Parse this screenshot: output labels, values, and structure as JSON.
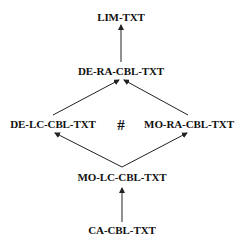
{
  "diagram": {
    "nodes": [
      {
        "id": "lim",
        "label": "LIM-TXT",
        "x": 121,
        "y": 17
      },
      {
        "id": "de_ra",
        "label": "DE-RA-CBL-TXT",
        "x": 121,
        "y": 71
      },
      {
        "id": "de_lc",
        "label": "DE-LC-CBL-TXT",
        "x": 53,
        "y": 124
      },
      {
        "id": "mo_ra",
        "label": "MO-RA-CBL-TXT",
        "x": 189,
        "y": 124
      },
      {
        "id": "mo_lc",
        "label": "MO-LC-CBL-TXT",
        "x": 122,
        "y": 177
      },
      {
        "id": "ca",
        "label": "CA-CBL-TXT",
        "x": 122,
        "y": 230
      }
    ],
    "separator": {
      "label": "#",
      "x": 121,
      "y": 124
    },
    "edges": [
      {
        "from": "ca",
        "to": "mo_lc"
      },
      {
        "from": "mo_lc",
        "to": "de_lc"
      },
      {
        "from": "mo_lc",
        "to": "mo_ra"
      },
      {
        "from": "de_lc",
        "to": "de_ra"
      },
      {
        "from": "mo_ra",
        "to": "de_ra"
      },
      {
        "from": "de_ra",
        "to": "lim"
      }
    ],
    "colors": {
      "line": "#222222",
      "text": "#111111",
      "background": "#ffffff"
    }
  }
}
